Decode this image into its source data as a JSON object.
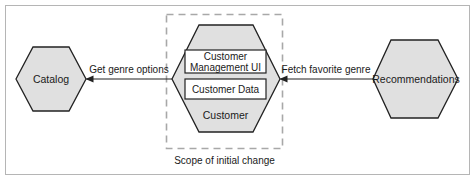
{
  "diagram": {
    "colors": {
      "hex_fill": "#e0e0e0",
      "stroke": "#222222",
      "frame": "#b5b5b5",
      "scope_dash": "#a8a8a8",
      "box_fill": "#ffffff"
    },
    "nodes": {
      "catalog": {
        "label": "Catalog"
      },
      "customer": {
        "label": "Customer",
        "components": [
          {
            "line1": "Customer",
            "line2": "Management UI"
          },
          {
            "label": "Customer Data"
          }
        ]
      },
      "recommendations": {
        "label": "Recommendations"
      }
    },
    "edges": [
      {
        "from": "customer",
        "to": "catalog",
        "label": "Get genre options"
      },
      {
        "from": "recommendations",
        "to": "customer",
        "label": "Fetch favorite genre"
      }
    ],
    "scope": {
      "label": "Scope of initial change"
    }
  }
}
